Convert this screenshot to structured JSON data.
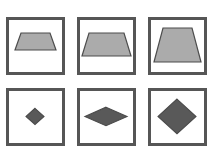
{
  "figure": {
    "title": "",
    "background_color": "#ffffff",
    "layout": {
      "rows": 2,
      "columns": 3,
      "cell_width": 59,
      "cell_height": 58,
      "col_x": [
        6,
        77,
        148
      ],
      "row_y": [
        17,
        88
      ],
      "border_color": "#565656",
      "border_width": 3
    },
    "palette": {
      "trapezoid_fill": "#ababab",
      "trapezoid_stroke": "#4d4d4d",
      "diamond_fill": "#595959",
      "diamond_stroke": "#4a4a4a",
      "frame": "#565656",
      "page": "#ffffff"
    },
    "cells": [
      {
        "id": "cell-1",
        "name": "trapezoid-small",
        "row": 1,
        "column": 1,
        "shape": "trapezoid",
        "size_label": "small",
        "fill": "#ababab",
        "stroke": "#4d4d4d",
        "width_px": 29,
        "height_px": 17,
        "points": "12,13 41,13 47,30 6,30"
      },
      {
        "id": "cell-2",
        "name": "trapezoid-medium",
        "row": 1,
        "column": 2,
        "shape": "trapezoid",
        "size_label": "medium",
        "fill": "#ababab",
        "stroke": "#4d4d4d",
        "width_px": 40,
        "height_px": 22,
        "points": "9,13 44,13 51,36 2,36"
      },
      {
        "id": "cell-3",
        "name": "trapezoid-large",
        "row": 1,
        "column": 3,
        "shape": "trapezoid",
        "size_label": "large",
        "fill": "#ababab",
        "stroke": "#4d4d4d",
        "width_px": 46,
        "height_px": 31,
        "points": "12,8 41,8 50,42 3,42"
      },
      {
        "id": "cell-4",
        "name": "diamond-small",
        "row": 2,
        "column": 1,
        "shape": "diamond",
        "size_label": "small",
        "fill": "#595959",
        "stroke": "#4a4a4a",
        "width_px": 18,
        "height_px": 13,
        "points": "26,15 35,22 26,29 17,22"
      },
      {
        "id": "cell-5",
        "name": "diamond-wide",
        "row": 2,
        "column": 2,
        "shape": "diamond",
        "size_label": "wide-flat",
        "fill": "#595959",
        "stroke": "#4a4a4a",
        "width_px": 42,
        "height_px": 16,
        "points": "26,14 47,22 26,30 5,22"
      },
      {
        "id": "cell-6",
        "name": "diamond-large",
        "row": 2,
        "column": 3,
        "shape": "diamond",
        "size_label": "large",
        "fill": "#595959",
        "stroke": "#4a4a4a",
        "width_px": 38,
        "height_px": 31,
        "points": "26,7 45,22 26,37 7,22"
      }
    ]
  }
}
